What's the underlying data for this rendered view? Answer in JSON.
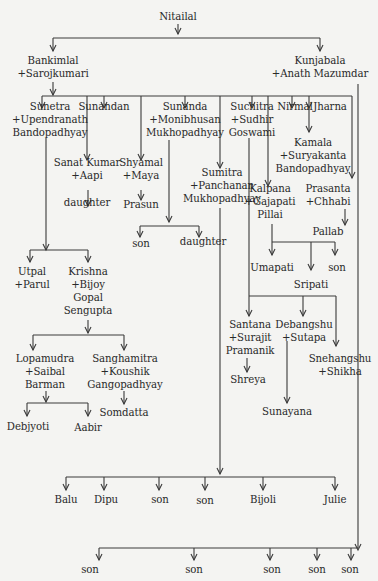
{
  "nodes": {
    "nitailal": [
      "Nitailal"
    ],
    "bankimlal": [
      "Bankimlal",
      "+Sarojkumari"
    ],
    "kunjabala": [
      "Kunjabala",
      "+Anath Mazumdar"
    ],
    "sunetra": [
      "Sunetra",
      "+Upendranath",
      "Bandopadhyay"
    ],
    "sunandan": [
      "Sunandan"
    ],
    "sananda": [
      "Sunanda",
      "+Monibhusan",
      "Mukhopadhyay"
    ],
    "suchitra": [
      "Suchitra",
      "+Sudhir",
      "Goswami"
    ],
    "nirmal": [
      "Nirmal"
    ],
    "jharna": [
      "Jharna"
    ],
    "sanat": [
      "Sanat Kumar",
      "+Aapi"
    ],
    "sanat_daughter": [
      "daughter"
    ],
    "shyamal": [
      "Shyamal",
      "+Maya"
    ],
    "prasun": [
      "Prasun"
    ],
    "sumitra": [
      "Sumitra",
      "+Panchanan",
      "Mukhopadhyay"
    ],
    "sumitra_son": [
      "son"
    ],
    "sumitra_daughter": [
      "daughter"
    ],
    "kamala": [
      "Kamala",
      "+Suryakanta",
      "Bandopadhyay"
    ],
    "kalpana": [
      "Kalpana",
      "+Gajapati",
      "Pillai"
    ],
    "prasanta": [
      "Prasanta",
      "+Chhabi"
    ],
    "pallab": [
      "Pallab"
    ],
    "umapati": [
      "Umapati"
    ],
    "kalpana_son": [
      "son"
    ],
    "sripati": [
      "Sripati"
    ],
    "utpal": [
      "Utpal",
      "+Parul"
    ],
    "krishna": [
      "Krishna",
      "+Bijoy",
      "Gopal",
      "Sengupta"
    ],
    "santana": [
      "Santana",
      "+Surajit",
      "Pramanik"
    ],
    "debangshu": [
      "Debangshu",
      "+Sutapa"
    ],
    "snehangshu": [
      "Snehangshu",
      "+Shikha"
    ],
    "shreya": [
      "Shreya"
    ],
    "sunayana": [
      "Sunayana"
    ],
    "lopamudra": [
      "Lopamudra",
      "+Saibal",
      "Barman"
    ],
    "sanghamitra": [
      "Sanghamitra",
      "+Koushik",
      "Gangopadhyay"
    ],
    "somdatta": [
      "Somdatta"
    ],
    "debjyoti": [
      "Debjyoti"
    ],
    "aabir": [
      "Aabir"
    ],
    "balu": [
      "Balu"
    ],
    "dipu": [
      "Dipu"
    ],
    "suchitra_son1": [
      "son"
    ],
    "suchitra_son2": [
      "son"
    ],
    "bijoli": [
      "Bijoli"
    ],
    "julie": [
      "Julie"
    ],
    "kunja_son1": [
      "son"
    ],
    "kunja_son2": [
      "son"
    ],
    "kunja_son3": [
      "son"
    ],
    "kunja_son4": [
      "son"
    ],
    "kunja_son5": [
      "son"
    ]
  },
  "relations": [
    {
      "parent": "nitailal",
      "children": [
        "bankimlal",
        "kunjabala"
      ]
    },
    {
      "parent": "bankimlal",
      "children": [
        "sunetra",
        "sunandan",
        "sanat",
        "shyamal",
        "sananda",
        "sumitra",
        "suchitra",
        "kalpana",
        "nirmal",
        "kamala",
        "jharna",
        "prasanta"
      ]
    },
    {
      "parent": "sanat",
      "children": [
        "sanat_daughter"
      ]
    },
    {
      "parent": "shyamal",
      "children": [
        "prasun"
      ]
    },
    {
      "parent": "sumitra",
      "children": [
        "sumitra_son",
        "sumitra_daughter"
      ]
    },
    {
      "parent": "prasanta",
      "children": [
        "pallab"
      ]
    },
    {
      "parent": "kalpana",
      "children": [
        "umapati",
        "sripati",
        "kalpana_son"
      ]
    },
    {
      "parent": "sunetra",
      "children": [
        "utpal",
        "krishna"
      ]
    },
    {
      "parent": "krishna",
      "children": [
        "lopamudra",
        "sanghamitra"
      ]
    },
    {
      "parent": "lopamudra",
      "children": [
        "debjyoti",
        "aabir"
      ]
    },
    {
      "parent": "sanghamitra",
      "children": [
        "somdatta"
      ]
    },
    {
      "parent": "suchitra",
      "children": [
        "santana",
        "debangshu",
        "snehangshu"
      ]
    },
    {
      "parent": "santana",
      "children": [
        "shreya"
      ]
    },
    {
      "parent": "debangshu",
      "children": [
        "sunayana"
      ]
    },
    {
      "parent": "sananda",
      "children": [
        "balu",
        "dipu",
        "suchitra_son1",
        "suchitra_son2",
        "bijoli",
        "julie"
      ]
    },
    {
      "parent": "kunjabala",
      "children": [
        "kunja_son1",
        "kunja_son2",
        "kunja_son3",
        "kunja_son4",
        "kunja_son5"
      ]
    }
  ]
}
